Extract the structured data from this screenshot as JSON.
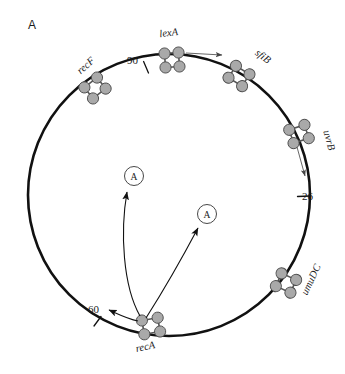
{
  "figure": {
    "panel_letter": "A",
    "type": "circular-chromosome-map",
    "background_color": "#ffffff",
    "line_color": "#111111",
    "protein_fill_color": "#a9a9a9",
    "protein_stroke_color": "#4d4d4d"
  },
  "chromosome": {
    "name": "circular chromosome",
    "center_x": 169,
    "center_y": 195,
    "radius": 141,
    "stroke_width": 2.6
  },
  "genes": [
    {
      "label": "recF",
      "angle_deg": 213,
      "label_x": 88,
      "label_y": 68,
      "label_rotation": -42,
      "cluster_x": 95,
      "cluster_y": 88
    },
    {
      "label": "lexA",
      "angle_deg": 265,
      "label_x": 169,
      "label_y": 36,
      "label_rotation": -7,
      "cluster_x": 172,
      "cluster_y": 60
    },
    {
      "label": "sfiB",
      "angle_deg": 307,
      "label_x": 261,
      "label_y": 59,
      "label_rotation": 38,
      "cluster_x": 239,
      "cluster_y": 76
    },
    {
      "label": "uvrB",
      "angle_deg": 344,
      "label_x": 326,
      "label_y": 141,
      "label_rotation": 75,
      "cluster_x": 299,
      "cluster_y": 134
    },
    {
      "label": "umuDC",
      "angle_deg": 40,
      "label_x": 314,
      "label_y": 281,
      "label_rotation": -65,
      "cluster_x": 286,
      "cluster_y": 283
    },
    {
      "label": "recA",
      "angle_deg": 80,
      "label_x": 146,
      "label_y": 350,
      "label_rotation": -12,
      "cluster_x": 151,
      "cluster_y": 326
    }
  ],
  "ticks": [
    {
      "label": "90",
      "label_x": 138,
      "label_y": 64,
      "angle_deg": 249
    },
    {
      "label": "26",
      "label_x": 313,
      "label_y": 200,
      "angle_deg": 1
    },
    {
      "label": "60",
      "label_x": 99,
      "label_y": 313,
      "angle_deg": 113
    }
  ],
  "nodes": [
    {
      "letter": "A",
      "cx": 134,
      "cy": 176,
      "r": 9.5
    },
    {
      "letter": "A",
      "cx": 207,
      "cy": 214,
      "r": 9.5
    }
  ],
  "arrows": [
    {
      "name": "lexA-transcription-arrow",
      "from": "lexA cluster",
      "direction": "right"
    },
    {
      "name": "uvrB-induction-arrow",
      "from": "uvrB cluster",
      "direction": "down"
    },
    {
      "name": "recA-to-60-arrow",
      "from": "recA cluster",
      "direction": "upper-left"
    },
    {
      "name": "recA-to-node-1-arrow",
      "from": "recA cluster",
      "direction": "up"
    },
    {
      "name": "recA-to-node-2-arrow",
      "from": "recA cluster",
      "direction": "upper-right"
    }
  ]
}
